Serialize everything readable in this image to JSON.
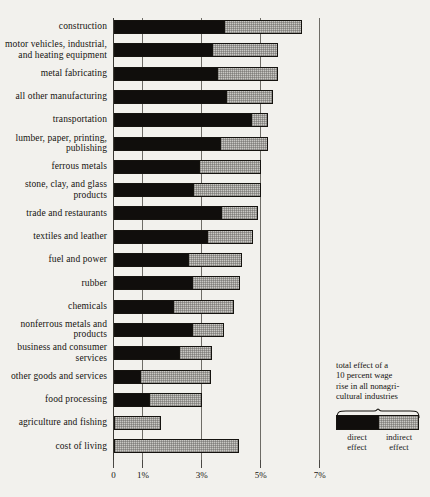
{
  "chart_data": {
    "type": "bar",
    "orientation": "horizontal",
    "stacked": true,
    "title": "",
    "xlabel": "",
    "ylabel": "",
    "xlim": [
      0,
      7
    ],
    "grid": true,
    "gridlines": [
      0,
      1,
      3,
      5,
      7
    ],
    "tick_labels": [
      "0",
      "1%",
      "3%",
      "5%",
      "7%"
    ],
    "legend_position": "right",
    "series": [
      {
        "name": "direct effect",
        "color": "#100e0c"
      },
      {
        "name": "indirect effect",
        "color": "#c9c8c4"
      }
    ],
    "categories": [
      "construction",
      "motor vehicles, industrial, and heating equipment",
      "metal fabricating",
      "all other manufacturing",
      "transportation",
      "lumber, paper, printing, publishing",
      "ferrous metals",
      "stone, clay, and glass products",
      "trade and restaurants",
      "textiles and leather",
      "fuel and power",
      "rubber",
      "chemicals",
      "nonferrous metals and products",
      "business and consumer services",
      "other goods and services",
      "food processing",
      "agriculture and fishing",
      "cost of living"
    ],
    "rows": [
      {
        "label": "construction",
        "label_lines": [
          "construction"
        ],
        "direct": 3.8,
        "indirect": 2.6,
        "total": 6.4
      },
      {
        "label": "motor vehicles, industrial, and heating equipment",
        "label_lines": [
          "motor vehicles, industrial,",
          "and heating equipment"
        ],
        "direct": 3.37,
        "indirect": 2.23,
        "total": 5.6
      },
      {
        "label": "metal fabricating",
        "label_lines": [
          "metal fabricating"
        ],
        "direct": 3.55,
        "indirect": 2.05,
        "total": 5.6
      },
      {
        "label": "all other manufacturing",
        "label_lines": [
          "all other manufacturing"
        ],
        "direct": 3.85,
        "indirect": 1.55,
        "total": 5.4
      },
      {
        "label": "transportation",
        "label_lines": [
          "transportation"
        ],
        "direct": 4.7,
        "indirect": 0.55,
        "total": 5.25
      },
      {
        "label": "lumber, paper, printing, publishing",
        "label_lines": [
          "lumber, paper, printing,",
          "publishing"
        ],
        "direct": 3.65,
        "indirect": 1.6,
        "total": 5.25
      },
      {
        "label": "ferrous metals",
        "label_lines": [
          "ferrous metals"
        ],
        "direct": 2.93,
        "indirect": 2.07,
        "total": 5.0
      },
      {
        "label": "stone, clay, and glass products",
        "label_lines": [
          "stone, clay, and glass",
          "products"
        ],
        "direct": 2.75,
        "indirect": 2.25,
        "total": 5.0
      },
      {
        "label": "trade and restaurants",
        "label_lines": [
          "trade and restaurants"
        ],
        "direct": 3.7,
        "indirect": 1.2,
        "total": 4.9
      },
      {
        "label": "textiles and leather",
        "label_lines": [
          "textiles and leather"
        ],
        "direct": 3.2,
        "indirect": 1.55,
        "total": 4.75
      },
      {
        "label": "fuel and power",
        "label_lines": [
          "fuel and power"
        ],
        "direct": 2.55,
        "indirect": 1.8,
        "total": 4.35
      },
      {
        "label": "rubber",
        "label_lines": [
          "rubber"
        ],
        "direct": 2.7,
        "indirect": 1.6,
        "total": 4.3
      },
      {
        "label": "chemicals",
        "label_lines": [
          "chemicals"
        ],
        "direct": 2.05,
        "indirect": 2.05,
        "total": 4.1
      },
      {
        "label": "nonferrous metals and products",
        "label_lines": [
          "nonferrous metals and",
          "products"
        ],
        "direct": 2.7,
        "indirect": 1.05,
        "total": 3.75
      },
      {
        "label": "business and consumer services",
        "label_lines": [
          "business and consumer",
          "services"
        ],
        "direct": 2.25,
        "indirect": 1.1,
        "total": 3.35
      },
      {
        "label": "other goods and services",
        "label_lines": [
          "other goods and services"
        ],
        "direct": 0.92,
        "indirect": 2.38,
        "total": 3.3
      },
      {
        "label": "food processing",
        "label_lines": [
          "food processing"
        ],
        "direct": 1.25,
        "indirect": 1.75,
        "total": 3.0
      },
      {
        "label": "agriculture and fishing",
        "label_lines": [
          "agriculture and fishing"
        ],
        "direct": 0.0,
        "indirect": 1.62,
        "total": 1.62
      },
      {
        "label": "cost of living",
        "label_lines": [
          "cost of living"
        ],
        "direct": 0.0,
        "indirect": 4.25,
        "total": 4.25
      }
    ]
  },
  "legend": {
    "caption_lines": [
      "total effect of a",
      "10 percent wage",
      "rise in all nonagri-",
      "cultural industries"
    ],
    "direct_label_lines": [
      "direct",
      "effect"
    ],
    "indirect_label_lines": [
      "indirect",
      "effect"
    ]
  },
  "colors": {
    "background": "#f2f1ed",
    "direct": "#100e0c",
    "indirect": "#c9c8c4",
    "gridline": "#6e6c66",
    "text": "#15130f"
  }
}
